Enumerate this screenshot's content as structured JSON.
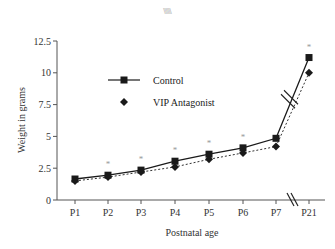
{
  "header_mark": "\\\\\\\\\\\\",
  "chart_data": {
    "type": "line",
    "title": "",
    "xlabel": "Postnatal age",
    "ylabel": "Weight in grams",
    "categories": [
      "P1",
      "P2",
      "P3",
      "P4",
      "P5",
      "P6",
      "P7",
      "P21"
    ],
    "ylim": [
      0,
      12.5
    ],
    "yticks": [
      0,
      2.5,
      5,
      7.5,
      10,
      12.5
    ],
    "ytick_labels": [
      "0",
      "2.5",
      "5",
      "7.5",
      "10",
      "12.5"
    ],
    "axis_break_between": [
      "P7",
      "P21"
    ],
    "grid": false,
    "legend_position": "top-left",
    "series": [
      {
        "name": "Control",
        "marker": "square",
        "line_style": "solid",
        "color": "#1a1a1a",
        "values": [
          1.65,
          1.95,
          2.35,
          3.05,
          3.6,
          4.1,
          4.85,
          11.2
        ]
      },
      {
        "name": "VIP Antagonist",
        "marker": "diamond",
        "line_style": "dotted",
        "color": "#1a1a1a",
        "values": [
          1.5,
          1.8,
          2.2,
          2.6,
          3.2,
          3.7,
          4.2,
          10.0
        ]
      }
    ],
    "significance": {
      "symbol": "*",
      "color": "#999999",
      "categories": [
        "P2",
        "P3",
        "P4",
        "P5",
        "P6",
        "P21"
      ]
    }
  }
}
